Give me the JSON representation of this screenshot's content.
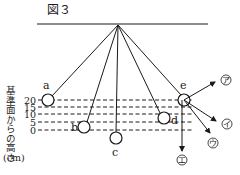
{
  "figure": {
    "title": "図３",
    "axis_label": "基準面からの高さ",
    "axis_unit": "(cm)",
    "pivot": {
      "x": 118,
      "y": 25
    },
    "ceiling": {
      "x1": 37,
      "x2": 208,
      "y": 24
    },
    "height_levels": [
      {
        "label": "20",
        "value": 20,
        "y": 100
      },
      {
        "label": "15",
        "value": 15,
        "y": 107
      },
      {
        "label": "10",
        "value": 10,
        "y": 114
      },
      {
        "label": "5",
        "value": 5,
        "y": 122
      },
      {
        "label": "0",
        "value": 0,
        "y": 130
      }
    ],
    "positions": [
      {
        "label": "a",
        "height_cm": 20
      },
      {
        "label": "b",
        "height_cm": 5
      },
      {
        "label": "c",
        "height_cm": 0
      },
      {
        "label": "d",
        "height_cm": 5
      },
      {
        "label": "e",
        "height_cm": 20
      }
    ],
    "direction_arrows": [
      {
        "label": "㋐",
        "description": "up-right"
      },
      {
        "label": "㋑",
        "description": "down-right"
      },
      {
        "label": "㋒",
        "description": "down-right steep"
      },
      {
        "label": "㋓",
        "description": "straight down"
      }
    ]
  }
}
